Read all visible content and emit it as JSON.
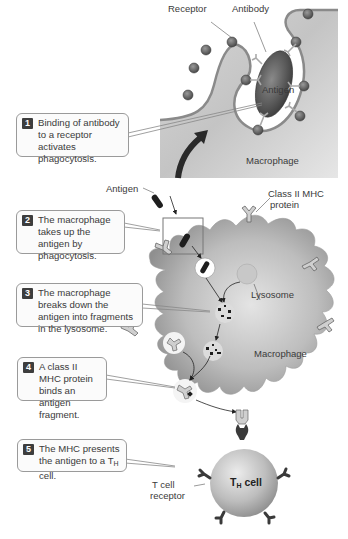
{
  "figure": {
    "inset": {
      "labels": {
        "receptor": "Receptor",
        "antibody": "Antibody",
        "antigen": "Antigen",
        "macrophage": "Macrophage"
      }
    },
    "main": {
      "labels": {
        "antigen": "Antigen",
        "class2_mhc_line1": "Class II MHC",
        "class2_mhc_line2": "protein",
        "lysosome": "Lysosome",
        "macrophage": "Macrophage",
        "tcr_line1": "T cell",
        "tcr_line2": "receptor",
        "th_cell_main": "T",
        "th_cell_sub": "H",
        "th_cell_suffix": " cell"
      }
    },
    "steps": [
      {
        "num": "1",
        "text": "Binding of antibody to a receptor activates phagocytosis."
      },
      {
        "num": "2",
        "text": "The macrophage takes up the antigen by phagocytosis."
      },
      {
        "num": "3",
        "text": "The macrophage breaks down the antigen into fragments in the lysosome."
      },
      {
        "num": "4",
        "text": "A class II MHC protein binds an antigen fragment."
      },
      {
        "num": "5",
        "text_pre": "The MHC presents the antigen to a T",
        "text_sub": "H",
        "text_post": " cell."
      }
    ],
    "colors": {
      "cell_fill": "#bdbdbd",
      "cell_dark": "#8a8a8a",
      "antigen": "#555555",
      "badge": "#3d3d3d",
      "callout_border": "#9a9a9a"
    }
  }
}
